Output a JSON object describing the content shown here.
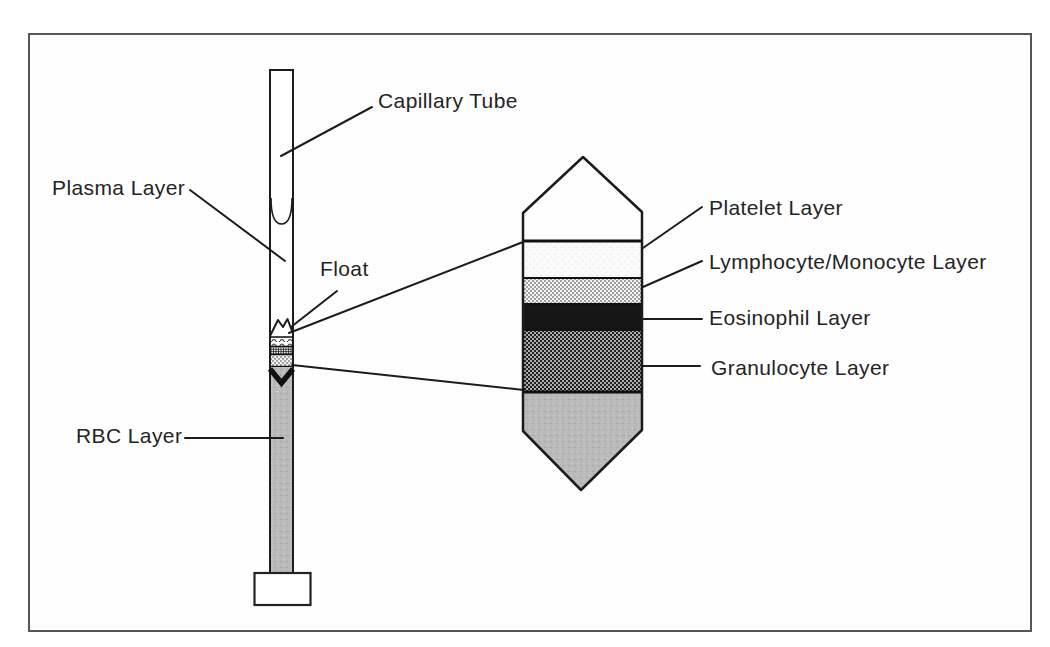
{
  "figure": {
    "labels": {
      "capillary_tube": "Capillary Tube",
      "plasma_layer": "Plasma Layer",
      "float": "Float",
      "rbc_layer": "RBC Layer",
      "platelet_layer": "Platelet Layer",
      "lymphocyte_monocyte_layer": "Lymphocyte/Monocyte Layer",
      "eosinophil_layer": "Eosinophil Layer",
      "granulocyte_layer": "Granulocyte Layer"
    },
    "enlarged_layers_top_to_bottom": [
      "Platelet Layer",
      "Lymphocyte/Monocyte Layer",
      "Eosinophil Layer",
      "Granulocyte Layer",
      "RBC Layer"
    ],
    "colors": {
      "line": "#1c1c1c",
      "frame_border": "#565656",
      "eosinophil_fill": "#161616",
      "rbc_gray": "#b9b9b9",
      "background": "#fefefe"
    }
  }
}
